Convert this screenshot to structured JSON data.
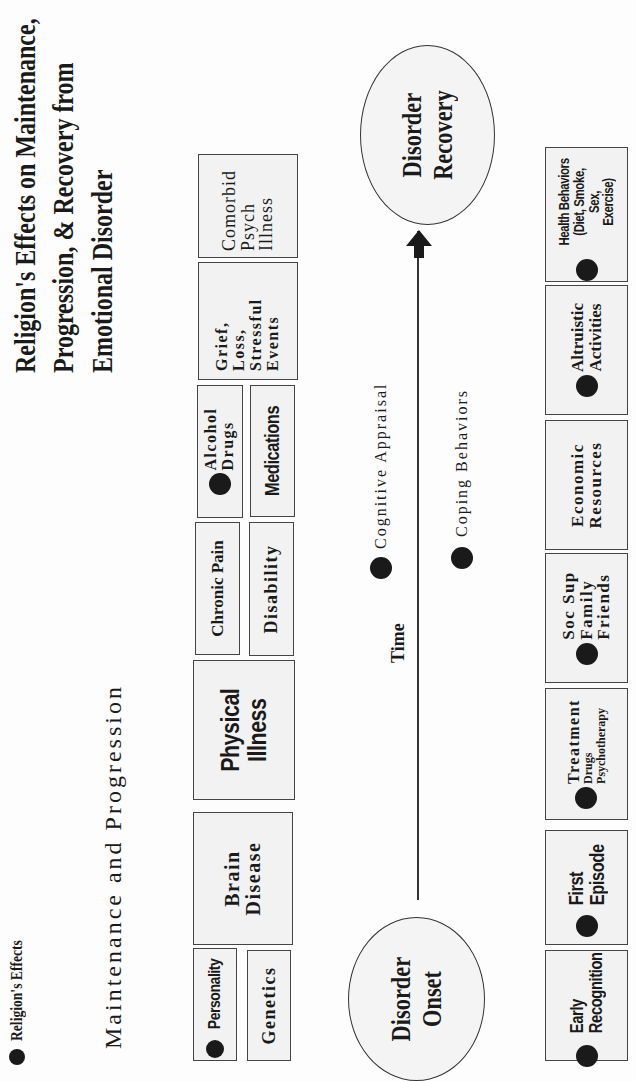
{
  "legend": {
    "label": "Religion's Effects",
    "marker": "filled-circle"
  },
  "title": {
    "line1": "Religion's Effects on Maintenance,",
    "line2": "Progression, & Recovery from",
    "line3": "Emotional Disorder"
  },
  "section_label": "Maintenance and Progression",
  "top_row": {
    "personality": {
      "label": "Personality",
      "religion_effect": true
    },
    "genetics": {
      "label": "Genetics",
      "religion_effect": false
    },
    "brain_disease": {
      "line1": "Brain",
      "line2": "Disease",
      "religion_effect": false
    },
    "physical_illness": {
      "line1": "Physical",
      "line2": "Illness",
      "religion_effect": false
    },
    "chronic_pain": {
      "label": "Chronic Pain",
      "religion_effect": false
    },
    "disability": {
      "label": "Disability",
      "religion_effect": false
    },
    "alcohol_drugs": {
      "line1": "Alcohol",
      "line2": "Drugs",
      "religion_effect": true
    },
    "medications": {
      "label": "Medications",
      "religion_effect": false
    },
    "grief": {
      "line1": "Grief,",
      "line2": "Loss,",
      "line3": "Stressful",
      "line4": "Events",
      "religion_effect": false
    },
    "comorbid": {
      "line1": "Comorbid",
      "line2": "Psych",
      "line3": "Illness",
      "religion_effect": false
    }
  },
  "timeline": {
    "onset": {
      "line1": "Disorder",
      "line2": "Onset"
    },
    "recovery": {
      "line1": "Disorder",
      "line2": "Recovery"
    },
    "axis_label": "Time",
    "cognitive_appraisal": {
      "label": "Cognitive Appraisal",
      "religion_effect": true
    },
    "coping_behaviors": {
      "label": "Coping Behaviors",
      "religion_effect": true
    }
  },
  "bottom_row": {
    "early_recognition": {
      "line1": "Early",
      "line2": "Recognition",
      "religion_effect": true
    },
    "first_episode": {
      "line1": "First",
      "line2": "Episode",
      "religion_effect": true
    },
    "treatment": {
      "line1": "Treatment",
      "line2": "Drugs",
      "line3": "Psychotherapy",
      "religion_effect": true
    },
    "social_support": {
      "line1": "Soc Sup",
      "line2": "Family",
      "line3": "Friends",
      "religion_effect": true
    },
    "economic_resources": {
      "line1": "Economic",
      "line2": "Resources",
      "religion_effect": false
    },
    "altruistic_activities": {
      "line1": "Altruistic",
      "line2": "Activities",
      "religion_effect": true
    },
    "health_behaviors": {
      "line1": "Health Behaviors",
      "line2": "(Diet, Smoke, Sex,",
      "line3": "Exercise)",
      "religion_effect": true
    }
  },
  "colors": {
    "ink": "#1a1a1a",
    "box_fill": "#f2f2f2",
    "border": "#444444",
    "background": "#fdfdfd"
  }
}
